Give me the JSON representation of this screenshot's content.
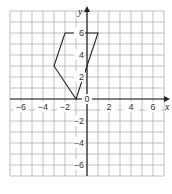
{
  "chart_data": {
    "type": "line",
    "title": "",
    "xlabel": "x",
    "ylabel": "y",
    "xlim": [
      -7,
      7
    ],
    "ylim": [
      -7,
      8
    ],
    "grid": true,
    "x_ticks": [
      -6,
      -4,
      -2,
      2,
      4,
      6
    ],
    "y_ticks": [
      -6,
      -4,
      -2,
      2,
      4,
      6
    ],
    "x_tick_labels": [
      "−6",
      "−4",
      "−2",
      "2",
      "4",
      "6"
    ],
    "y_tick_labels": [
      "−6",
      "−4",
      "−2",
      "2",
      "4",
      "6"
    ],
    "origin_label": "0",
    "series": [
      {
        "name": "quadrilateral",
        "closed": true,
        "points": [
          [
            -2,
            6
          ],
          [
            1,
            6
          ],
          [
            -1,
            0
          ],
          [
            -3,
            3
          ]
        ]
      }
    ]
  },
  "colors": {
    "grid": "#b0b0b0",
    "axis": "#222222",
    "shape": "#222222",
    "background": "#ffffff"
  }
}
